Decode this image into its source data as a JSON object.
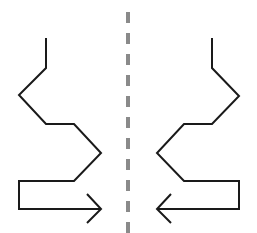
{
  "diagram": {
    "colors": {
      "background": "#ffffff",
      "stroke": "#1a1a1a",
      "axis": "#8a8a8a"
    },
    "axis": {
      "x": 128,
      "y1": 12,
      "y2": 233,
      "width": 4,
      "dash": "11 10"
    },
    "left_path": {
      "points": "46,38 46,68 19,95 46,124 74,124 101,153 74,181 19,181 19,209 101,209",
      "arrowhead": "87,194 101,209 87,223"
    },
    "right_path": {
      "points": "212,38 212,68 239,96 212,124 184,124 157,153 184,181 239,181 239,209 157,209",
      "arrowhead": "171,194 157,209 171,223"
    },
    "stroke_width": 2
  }
}
